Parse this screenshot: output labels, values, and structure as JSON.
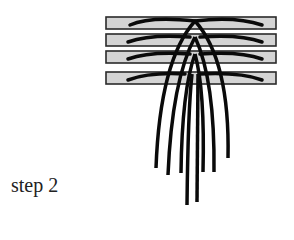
{
  "caption": "step 2",
  "colors": {
    "bar_fill": "#d4d4d4",
    "bar_stroke": "#2a2a2a",
    "strand": "#0a0a0a",
    "text": "#222222"
  },
  "bars": [
    {
      "x": 106,
      "y": 17,
      "w": 170,
      "h": 12
    },
    {
      "x": 106,
      "y": 34,
      "w": 170,
      "h": 12
    },
    {
      "x": 106,
      "y": 51,
      "w": 170,
      "h": 12
    },
    {
      "x": 106,
      "y": 72,
      "w": 170,
      "h": 12
    }
  ],
  "strand_count": 8
}
